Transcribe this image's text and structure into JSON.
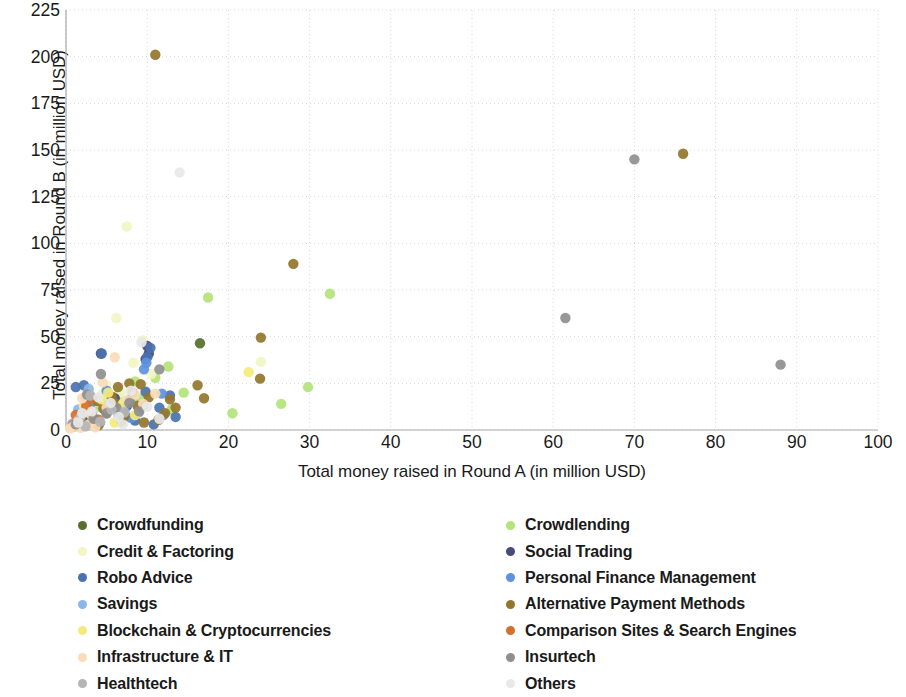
{
  "chart_data": {
    "type": "scatter",
    "title": "",
    "xlabel": "Total money raised in Round A (in million USD)",
    "ylabel": "Total money raised in Round B (in million USD)",
    "xlim": [
      0,
      100
    ],
    "ylim": [
      0,
      225
    ],
    "xticks": [
      0,
      10,
      20,
      30,
      40,
      50,
      60,
      70,
      80,
      90,
      100
    ],
    "yticks": [
      0,
      25,
      50,
      75,
      100,
      125,
      150,
      175,
      200,
      225
    ],
    "grid": true,
    "legend_position": "below-two-columns",
    "series": [
      {
        "name": "Crowdfunding",
        "color": "#57702e",
        "points": [
          [
            16.5,
            46.5
          ],
          [
            5.5,
            16.0
          ],
          [
            3.2,
            11.0
          ],
          [
            7.0,
            9.0
          ],
          [
            2.0,
            5.0
          ],
          [
            9.5,
            13.5
          ]
        ]
      },
      {
        "name": "Crowdlending",
        "color": "#b4e37a",
        "points": [
          [
            17.5,
            71.0
          ],
          [
            32.5,
            73.0
          ],
          [
            29.8,
            23.0
          ],
          [
            20.5,
            9.0
          ],
          [
            26.5,
            14.0
          ],
          [
            13.0,
            11.0
          ],
          [
            12.6,
            34.0
          ],
          [
            11.0,
            28.0
          ],
          [
            8.5,
            26.0
          ],
          [
            6.5,
            19.0
          ],
          [
            4.0,
            12.5
          ],
          [
            2.5,
            7.0
          ],
          [
            1.2,
            4.0
          ],
          [
            9.0,
            17.0
          ],
          [
            14.5,
            20.0
          ]
        ]
      },
      {
        "name": "Credit & Factoring",
        "color": "#f2f5c4",
        "points": [
          [
            7.5,
            109.0
          ],
          [
            6.2,
            60.0
          ],
          [
            9.5,
            48.0
          ],
          [
            8.3,
            36.0
          ],
          [
            5.0,
            24.0
          ],
          [
            6.8,
            20.0
          ],
          [
            3.5,
            15.0
          ],
          [
            4.5,
            19.5
          ],
          [
            2.2,
            8.0
          ],
          [
            1.5,
            5.5
          ],
          [
            10.5,
            30.0
          ],
          [
            24.0,
            36.5
          ],
          [
            3.0,
            18.0
          ]
        ]
      },
      {
        "name": "Social Trading",
        "color": "#4a4a7a",
        "points": [
          [
            10.0,
            45.0
          ],
          [
            10.2,
            41.0
          ],
          [
            4.3,
            41.0
          ],
          [
            9.8,
            38.0
          ],
          [
            6.0,
            17.0
          ],
          [
            3.2,
            9.5
          ],
          [
            7.5,
            13.0
          ],
          [
            2.0,
            6.0
          ],
          [
            1.0,
            3.0
          ]
        ]
      },
      {
        "name": "Robo Advice",
        "color": "#4972b0",
        "points": [
          [
            10.4,
            44.0
          ],
          [
            4.4,
            41.0
          ],
          [
            10.0,
            39.0
          ],
          [
            2.2,
            24.0
          ],
          [
            1.2,
            23.0
          ],
          [
            9.8,
            20.5
          ],
          [
            12.8,
            18.5
          ],
          [
            11.5,
            12.0
          ],
          [
            10.8,
            3.0
          ],
          [
            8.5,
            5.0
          ],
          [
            6.5,
            7.5
          ],
          [
            3.0,
            10.5
          ],
          [
            5.2,
            13.5
          ],
          [
            7.8,
            16.0
          ],
          [
            13.5,
            7.0
          ]
        ]
      },
      {
        "name": "Personal Finance Management",
        "color": "#5b93e0",
        "points": [
          [
            9.9,
            36.0
          ],
          [
            9.6,
            32.5
          ],
          [
            5.0,
            21.0
          ],
          [
            11.8,
            19.5
          ],
          [
            3.0,
            14.0
          ],
          [
            7.2,
            11.0
          ],
          [
            1.8,
            9.0
          ],
          [
            8.0,
            6.5
          ],
          [
            4.2,
            4.0
          ],
          [
            12.0,
            8.0
          ],
          [
            2.4,
            17.5
          ]
        ]
      },
      {
        "name": "Savings",
        "color": "#8cb6e8",
        "points": [
          [
            2.8,
            22.0
          ],
          [
            5.5,
            15.0
          ],
          [
            1.5,
            11.0
          ],
          [
            7.0,
            8.0
          ],
          [
            3.6,
            6.0
          ],
          [
            9.0,
            9.5
          ],
          [
            0.8,
            3.5
          ],
          [
            6.2,
            13.0
          ]
        ]
      },
      {
        "name": "Alternative Payment Methods",
        "color": "#94762b",
        "points": [
          [
            11.0,
            201.0
          ],
          [
            76.0,
            148.0
          ],
          [
            28.0,
            89.0
          ],
          [
            24.0,
            49.5
          ],
          [
            16.2,
            24.0
          ],
          [
            23.9,
            27.5
          ],
          [
            17.0,
            17.0
          ],
          [
            12.8,
            16.5
          ],
          [
            9.2,
            24.5
          ],
          [
            7.8,
            25.0
          ],
          [
            6.4,
            23.0
          ],
          [
            10.2,
            17.5
          ],
          [
            8.8,
            13.0
          ],
          [
            5.0,
            9.0
          ],
          [
            3.2,
            6.0
          ],
          [
            2.0,
            3.5
          ],
          [
            4.6,
            11.5
          ],
          [
            6.0,
            14.5
          ],
          [
            7.2,
            7.5
          ],
          [
            13.5,
            12.0
          ],
          [
            11.4,
            5.5
          ],
          [
            1.0,
            2.0
          ],
          [
            9.6,
            4.0
          ],
          [
            3.8,
            15.5
          ],
          [
            5.6,
            18.0
          ],
          [
            8.2,
            20.0
          ],
          [
            2.6,
            12.0
          ],
          [
            4.0,
            2.5
          ],
          [
            6.8,
            4.5
          ],
          [
            12.2,
            9.0
          ]
        ]
      },
      {
        "name": "Blockchain & Cryptocurrencies",
        "color": "#f5ea7a",
        "points": [
          [
            22.5,
            31.0
          ],
          [
            5.2,
            20.0
          ],
          [
            7.0,
            14.0
          ],
          [
            3.0,
            10.0
          ],
          [
            1.6,
            6.5
          ],
          [
            8.5,
            8.0
          ],
          [
            4.4,
            16.5
          ],
          [
            2.2,
            13.0
          ],
          [
            6.0,
            4.0
          ]
        ]
      },
      {
        "name": "Comparison Sites & Search Engines",
        "color": "#d2702f",
        "points": [
          [
            2.5,
            13.0
          ],
          [
            1.2,
            8.0
          ],
          [
            4.0,
            5.5
          ],
          [
            0.8,
            2.5
          ],
          [
            3.2,
            17.0
          ]
        ]
      },
      {
        "name": "Infrastructure & IT",
        "color": "#fadcb8",
        "points": [
          [
            6.0,
            39.0
          ],
          [
            4.5,
            25.5
          ],
          [
            11.0,
            19.5
          ],
          [
            2.0,
            17.0
          ],
          [
            7.5,
            16.0
          ],
          [
            5.0,
            12.0
          ],
          [
            3.0,
            8.5
          ],
          [
            1.5,
            5.0
          ],
          [
            8.5,
            19.0
          ],
          [
            0.9,
            2.0
          ],
          [
            2.8,
            3.0
          ],
          [
            1.8,
            1.2
          ],
          [
            9.5,
            14.0
          ],
          [
            0.5,
            0.8
          ],
          [
            3.6,
            1.5
          ]
        ]
      },
      {
        "name": "Insurtech",
        "color": "#8f8f8f",
        "points": [
          [
            70.0,
            145.0
          ],
          [
            61.5,
            60.0
          ],
          [
            88.0,
            35.0
          ],
          [
            11.5,
            32.5
          ],
          [
            4.3,
            30.0
          ],
          [
            2.6,
            19.0
          ],
          [
            6.2,
            12.0
          ],
          [
            5.0,
            9.0
          ],
          [
            3.4,
            6.0
          ],
          [
            7.8,
            14.5
          ],
          [
            1.2,
            3.0
          ],
          [
            9.0,
            10.0
          ]
        ]
      },
      {
        "name": "Healthtech",
        "color": "#b5b5b5",
        "points": [
          [
            3.0,
            18.5
          ],
          [
            5.6,
            11.0
          ],
          [
            1.8,
            7.0
          ],
          [
            7.2,
            9.5
          ],
          [
            4.2,
            4.5
          ],
          [
            2.4,
            2.0
          ]
        ]
      },
      {
        "name": "Others",
        "color": "#e8e8e8",
        "points": [
          [
            14.0,
            138.0
          ],
          [
            9.3,
            47.0
          ],
          [
            8.0,
            21.0
          ],
          [
            5.5,
            14.5
          ],
          [
            3.2,
            10.0
          ],
          [
            6.5,
            7.0
          ],
          [
            1.5,
            4.0
          ],
          [
            10.0,
            12.5
          ],
          [
            4.0,
            17.5
          ],
          [
            2.0,
            9.0
          ],
          [
            7.0,
            3.0
          ],
          [
            11.5,
            6.0
          ]
        ]
      }
    ]
  },
  "axes": {
    "x_title": "Total money raised in Round A (in million USD)",
    "y_title": "Total money raised in Round B (in million USD)",
    "x_tick_labels": [
      "0",
      "10",
      "20",
      "30",
      "40",
      "50",
      "60",
      "70",
      "80",
      "90",
      "100"
    ],
    "y_tick_labels": [
      "0",
      "25",
      "50",
      "75",
      "100",
      "125",
      "150",
      "175",
      "200",
      "225"
    ]
  },
  "legend": {
    "left_column": [
      {
        "label": "Crowdfunding",
        "color": "#57702e"
      },
      {
        "label": "Credit & Factoring",
        "color": "#f2f5c4"
      },
      {
        "label": "Robo Advice",
        "color": "#4972b0"
      },
      {
        "label": "Savings",
        "color": "#8cb6e8"
      },
      {
        "label": "Blockchain & Cryptocurrencies",
        "color": "#f5ea7a"
      },
      {
        "label": "Infrastructure & IT",
        "color": "#fadcb8"
      },
      {
        "label": "Healthtech",
        "color": "#b5b5b5"
      }
    ],
    "right_column": [
      {
        "label": "Crowdlending",
        "color": "#b4e37a"
      },
      {
        "label": "Social Trading",
        "color": "#4a4a7a"
      },
      {
        "label": "Personal Finance Management",
        "color": "#5b93e0"
      },
      {
        "label": "Alternative Payment Methods",
        "color": "#94762b"
      },
      {
        "label": "Comparison Sites & Search Engines",
        "color": "#d2702f"
      },
      {
        "label": "Insurtech",
        "color": "#8f8f8f"
      },
      {
        "label": "Others",
        "color": "#e8e8e8"
      }
    ]
  }
}
